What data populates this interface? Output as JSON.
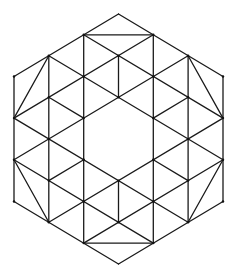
{
  "figure": {
    "type": "geometric-tessellation",
    "width": 237,
    "height": 279,
    "stroke_color": "#1a1a1a",
    "background_color": "#ffffff",
    "lattice": {
      "origin_x": 14,
      "origin_y": 14,
      "step_x": 34.83,
      "step_y": 20.83
    },
    "outer_hexagon": [
      [
        3,
        0
      ],
      [
        6,
        3
      ],
      [
        6,
        9
      ],
      [
        3,
        12
      ],
      [
        0,
        9
      ],
      [
        0,
        3
      ]
    ],
    "inner_hexagon_hole": [
      [
        3,
        4
      ],
      [
        4,
        5
      ],
      [
        4,
        7
      ],
      [
        3,
        8
      ],
      [
        2,
        7
      ],
      [
        2,
        5
      ]
    ],
    "segments": [
      [
        [
          3,
          0
        ],
        [
          6,
          3
        ]
      ],
      [
        [
          6,
          3
        ],
        [
          6,
          9
        ]
      ],
      [
        [
          6,
          9
        ],
        [
          3,
          12
        ]
      ],
      [
        [
          3,
          12
        ],
        [
          0,
          9
        ]
      ],
      [
        [
          0,
          9
        ],
        [
          0,
          3
        ]
      ],
      [
        [
          0,
          3
        ],
        [
          3,
          0
        ]
      ],
      [
        [
          2,
          1
        ],
        [
          4,
          1
        ]
      ],
      [
        [
          2,
          11
        ],
        [
          4,
          11
        ]
      ],
      [
        [
          1,
          2
        ],
        [
          0,
          5
        ]
      ],
      [
        [
          5,
          2
        ],
        [
          6,
          5
        ]
      ],
      [
        [
          0,
          7
        ],
        [
          1,
          10
        ]
      ],
      [
        [
          6,
          7
        ],
        [
          5,
          10
        ]
      ],
      [
        [
          1,
          2
        ],
        [
          1,
          10
        ]
      ],
      [
        [
          2,
          1
        ],
        [
          2,
          11
        ]
      ],
      [
        [
          4,
          1
        ],
        [
          4,
          11
        ]
      ],
      [
        [
          5,
          2
        ],
        [
          5,
          10
        ]
      ],
      [
        [
          3,
          2
        ],
        [
          3,
          4
        ]
      ],
      [
        [
          3,
          8
        ],
        [
          3,
          10
        ]
      ],
      [
        [
          2,
          1
        ],
        [
          6,
          5
        ]
      ],
      [
        [
          1,
          2
        ],
        [
          6,
          7
        ]
      ],
      [
        [
          1,
          4
        ],
        [
          2,
          5
        ]
      ],
      [
        [
          0,
          5
        ],
        [
          5,
          10
        ]
      ],
      [
        [
          0,
          7
        ],
        [
          4,
          11
        ]
      ],
      [
        [
          4,
          7
        ],
        [
          5,
          8
        ]
      ],
      [
        [
          4,
          1
        ],
        [
          0,
          5
        ]
      ],
      [
        [
          5,
          2
        ],
        [
          0,
          7
        ]
      ],
      [
        [
          5,
          4
        ],
        [
          4,
          5
        ]
      ],
      [
        [
          6,
          5
        ],
        [
          1,
          10
        ]
      ],
      [
        [
          6,
          7
        ],
        [
          2,
          11
        ]
      ],
      [
        [
          2,
          7
        ],
        [
          1,
          8
        ]
      ]
    ],
    "vertex_dots": [
      [
        2,
        1
      ],
      [
        4,
        1
      ],
      [
        1,
        2
      ],
      [
        3,
        2
      ],
      [
        5,
        2
      ],
      [
        0,
        3
      ],
      [
        2,
        3
      ],
      [
        4,
        3
      ],
      [
        6,
        3
      ],
      [
        1,
        4
      ],
      [
        3,
        4
      ],
      [
        5,
        4
      ],
      [
        0,
        5
      ],
      [
        2,
        5
      ],
      [
        4,
        5
      ],
      [
        6,
        5
      ],
      [
        1,
        6
      ],
      [
        5,
        6
      ],
      [
        0,
        7
      ],
      [
        2,
        7
      ],
      [
        4,
        7
      ],
      [
        6,
        7
      ],
      [
        1,
        8
      ],
      [
        3,
        8
      ],
      [
        5,
        8
      ],
      [
        0,
        9
      ],
      [
        2,
        9
      ],
      [
        4,
        9
      ],
      [
        6,
        9
      ],
      [
        1,
        10
      ],
      [
        3,
        10
      ],
      [
        5,
        10
      ],
      [
        2,
        11
      ],
      [
        4,
        11
      ]
    ]
  }
}
